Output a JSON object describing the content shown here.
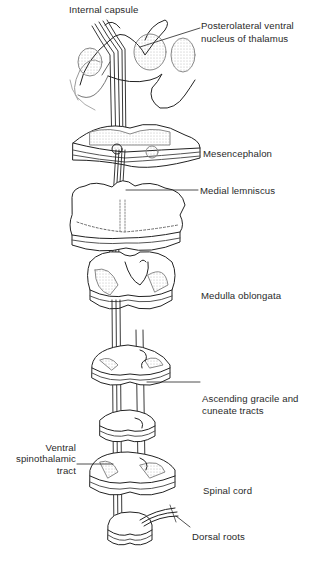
{
  "diagram": {
    "type": "anatomical-pathway",
    "labels": {
      "internal_capsule": "Internal capsule",
      "plv_nucleus_line1": "Posterolateral ventral",
      "plv_nucleus_line2": "nucleus of thalamus",
      "mesencephalon": "Mesencephalon",
      "medial_lemniscus": "Medial lemniscus",
      "medulla_oblongata": "Medulla oblongata",
      "ascending_line1": "Ascending gracile and",
      "ascending_line2": "cuneate tracts",
      "ventral_line1": "Ventral",
      "ventral_line2": "spinothalamic",
      "ventral_line3": "tract",
      "spinal_cord": "Spinal cord",
      "dorsal_roots": "Dorsal roots"
    },
    "colors": {
      "ink": "#222222",
      "background": "#ffffff",
      "stipple": "#888888"
    }
  }
}
